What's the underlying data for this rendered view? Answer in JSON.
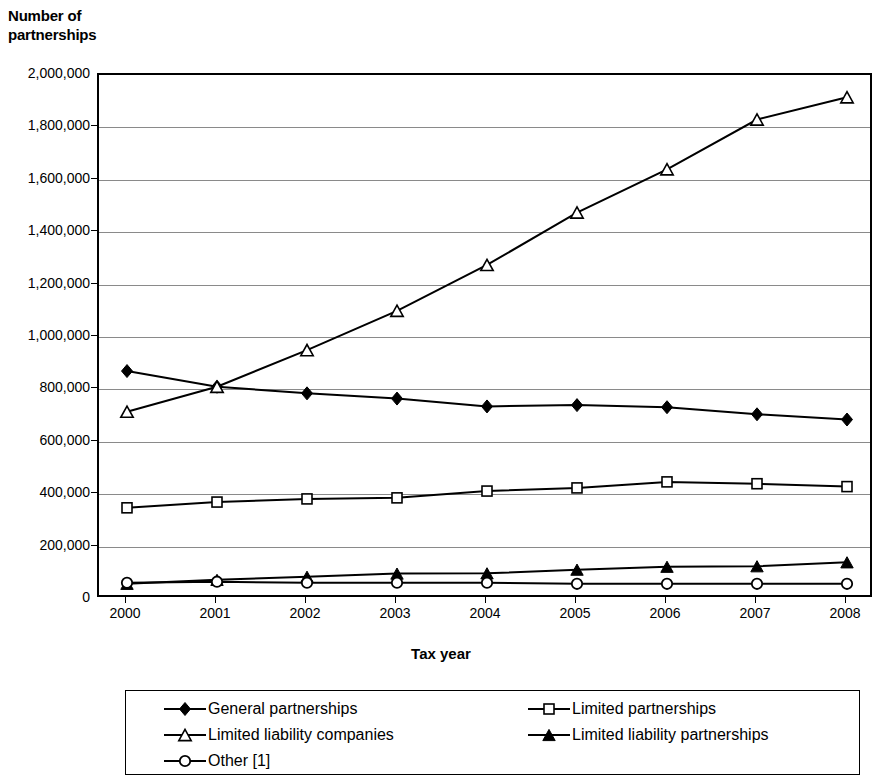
{
  "chart_data": {
    "type": "line",
    "title": "",
    "ylabel": "Number of\npartnerships",
    "xlabel": "Tax year",
    "ylim": [
      0,
      2000000
    ],
    "grid": true,
    "legend_position": "bottom",
    "categories": [
      "2000",
      "2001",
      "2002",
      "2003",
      "2004",
      "2005",
      "2006",
      "2007",
      "2008"
    ],
    "x": [
      2000,
      2001,
      2002,
      2003,
      2004,
      2005,
      2006,
      2007,
      2008
    ],
    "y_ticks": [
      "0",
      "200,000",
      "400,000",
      "600,000",
      "800,000",
      "1,000,000",
      "1,200,000",
      "1,400,000",
      "1,600,000",
      "1,800,000",
      "2,000,000"
    ],
    "y_tick_values": [
      0,
      200000,
      400000,
      600000,
      800000,
      1000000,
      1200000,
      1400000,
      1600000,
      1800000,
      2000000
    ],
    "series": [
      {
        "name": "General partnerships",
        "marker": "filled-diamond",
        "color": "#000000",
        "values": [
          870000,
          810000,
          785000,
          765000,
          735000,
          740000,
          732000,
          705000,
          685000
        ]
      },
      {
        "name": "Limited partnerships",
        "marker": "open-square",
        "color": "#000000",
        "values": [
          348000,
          370000,
          382000,
          386000,
          412000,
          424000,
          447000,
          440000,
          429000
        ]
      },
      {
        "name": "Limited liability companies",
        "marker": "open-triangle",
        "color": "#000000",
        "values": [
          715000,
          810000,
          950000,
          1100000,
          1275000,
          1475000,
          1640000,
          1830000,
          1915000
        ]
      },
      {
        "name": "Limited liability partnerships",
        "marker": "filled-triangle",
        "color": "#000000",
        "values": [
          58000,
          73000,
          85000,
          97000,
          98000,
          112000,
          123000,
          125000,
          140000
        ]
      },
      {
        "name": "Other [1]",
        "marker": "open-circle",
        "color": "#000000",
        "values": [
          62000,
          66000,
          62000,
          62000,
          62000,
          58000,
          58000,
          58000,
          58000
        ]
      }
    ]
  },
  "legend": {
    "entries": [
      {
        "label": "General partnerships",
        "marker": "filled-diamond"
      },
      {
        "label": "Limited partnerships",
        "marker": "open-square"
      },
      {
        "label": "Limited liability companies",
        "marker": "open-triangle"
      },
      {
        "label": "Limited liability partnerships",
        "marker": "filled-triangle"
      },
      {
        "label": "Other [1]",
        "marker": "open-circle"
      }
    ]
  }
}
